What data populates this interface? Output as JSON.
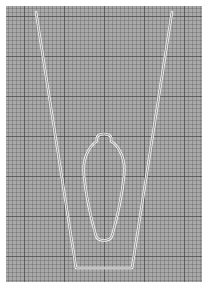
{
  "sheet": {
    "background_color": "#a9a9a9",
    "grid_minor_color": "#5a5a5a",
    "grid_major_color": "#3c3c3c",
    "outline_color": "#f2f2f2"
  },
  "shapes": {
    "outer_trapezoid": {
      "points": [
        [
          36,
          12
        ],
        [
          172,
          12
        ],
        [
          132,
          268
        ],
        [
          76,
          268
        ]
      ]
    },
    "inner_loop": {
      "top": [
        104,
        132
      ],
      "bottom_y": 242,
      "center_x": 104
    }
  }
}
